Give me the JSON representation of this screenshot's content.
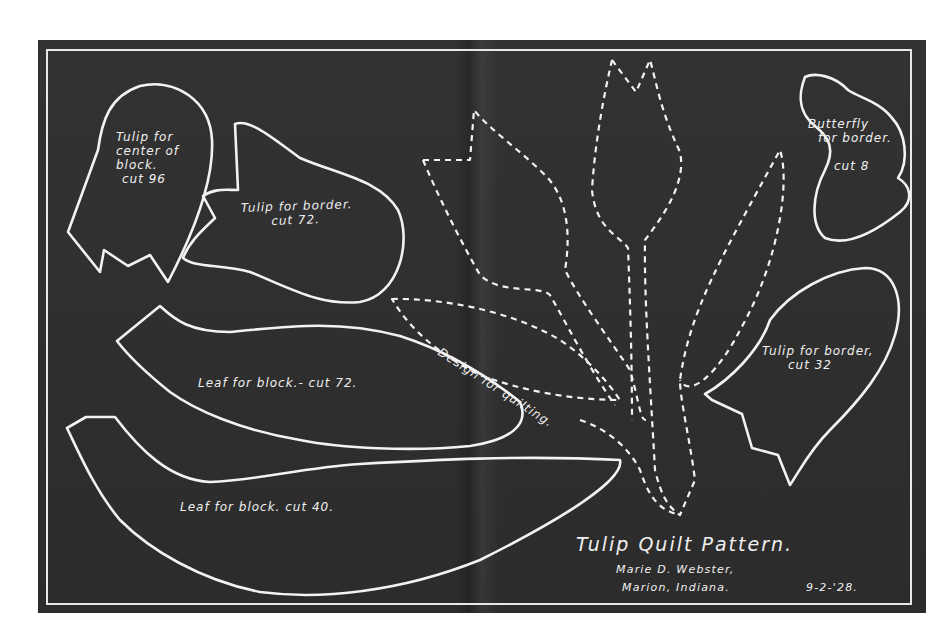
{
  "document": {
    "title": "Tulip Quilt Pattern.",
    "author": "Marie D. Webster,",
    "location": "Marion, Indiana.",
    "date": "9-2-'28.",
    "colors": {
      "board": "#2e2e2e",
      "chalk": "#f2f2f2",
      "page": "#ffffff"
    }
  },
  "pieces": [
    {
      "id": "tulip-center",
      "lines": [
        "Tulip for",
        "center of",
        "block.",
        "cut 96"
      ]
    },
    {
      "id": "tulip-border-72",
      "lines": [
        "Tulip for border.",
        "cut 72."
      ]
    },
    {
      "id": "butterfly",
      "lines": [
        "Butterfly",
        "for border.",
        "cut 8"
      ]
    },
    {
      "id": "tulip-border-32",
      "lines": [
        "Tulip for border,",
        "cut 32"
      ]
    },
    {
      "id": "leaf-72",
      "lines": [
        "Leaf for block.- cut 72."
      ]
    },
    {
      "id": "leaf-40",
      "lines": [
        "Leaf for block. cut 40."
      ]
    }
  ],
  "quilting_design": {
    "label": "Design for quilting."
  }
}
